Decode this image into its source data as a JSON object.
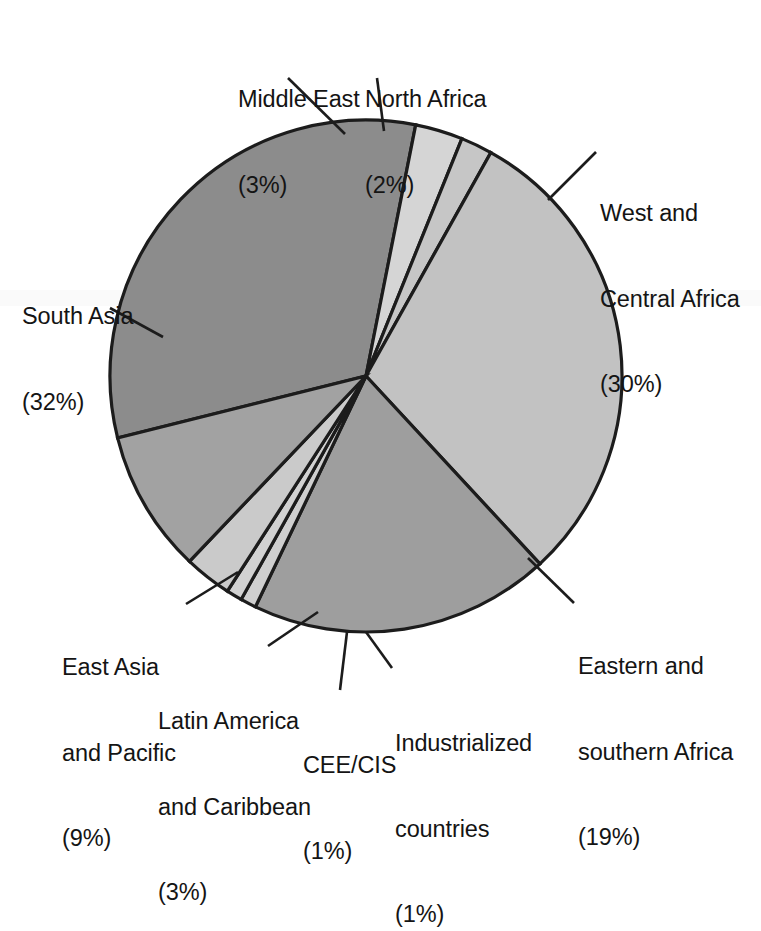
{
  "chart_data": {
    "type": "pie",
    "title": "",
    "subtitle": "",
    "xlabel": "",
    "ylabel": "",
    "legend_position": "callout-labels",
    "grid": false,
    "units": "percent",
    "total": 100,
    "categories": [
      "South Asia",
      "Middle East",
      "North Africa",
      "West and Central Africa",
      "Eastern and southern Africa",
      "Industrialized countries",
      "CEE/CIS",
      "Latin America and Caribbean",
      "East Asia and Pacific"
    ],
    "values": [
      32,
      3,
      2,
      30,
      19,
      1,
      1,
      3,
      9
    ],
    "slices": [
      {
        "name": "south-asia",
        "label_lines": [
          "South Asia",
          "(32%)"
        ],
        "value": 32,
        "value_text": "(32%)",
        "color": "#8c8c8c",
        "start_angle": 256.0,
        "end_angle": 371.2
      },
      {
        "name": "middle-east",
        "label_lines": [
          "Middle East",
          "(3%)"
        ],
        "value": 3,
        "value_text": "(3%)",
        "color": "#d5d5d5",
        "start_angle": 371.2,
        "end_angle": 382.0
      },
      {
        "name": "north-africa",
        "label_lines": [
          "North Africa",
          "(2%)"
        ],
        "value": 2,
        "value_text": "(2%)",
        "color": "#c6c6c6",
        "start_angle": 382.0,
        "end_angle": 389.2
      },
      {
        "name": "west-and-central-africa",
        "label_lines": [
          "West and",
          "Central Africa",
          "(30%)"
        ],
        "value": 30,
        "value_text": "(30%)",
        "color": "#c2c2c2",
        "start_angle": 389.2,
        "end_angle": 497.2
      },
      {
        "name": "eastern-and-southern-africa",
        "label_lines": [
          "Eastern and",
          "southern Africa",
          "(19%)"
        ],
        "value": 19,
        "value_text": "(19%)",
        "color": "#9e9e9e",
        "start_angle": 497.2,
        "end_angle": 565.6
      },
      {
        "name": "industrialized-countries",
        "label_lines": [
          "Industrialized",
          "countries",
          "(1%)"
        ],
        "value": 1,
        "value_text": "(1%)",
        "color": "#cfcfcf",
        "start_angle": 565.6,
        "end_angle": 569.2
      },
      {
        "name": "cee-cis",
        "label_lines": [
          "CEE/CIS",
          "(1%)"
        ],
        "value": 1,
        "value_text": "(1%)",
        "color": "#d2d2d2",
        "start_angle": 569.2,
        "end_angle": 572.8
      },
      {
        "name": "latin-america-and-caribbean",
        "label_lines": [
          "Latin America",
          "and Caribbean",
          "(3%)"
        ],
        "value": 3,
        "value_text": "(3%)",
        "color": "#cacaca",
        "start_angle": 572.8,
        "end_angle": 583.6
      },
      {
        "name": "east-asia-and-pacific",
        "label_lines": [
          "East Asia",
          "and Pacific",
          "(9%)"
        ],
        "value": 9,
        "value_text": "(9%)",
        "color": "#a2a2a2",
        "start_angle": 583.6,
        "end_angle": 616.0
      }
    ],
    "geometry": {
      "center_x": 366,
      "center_y": 376,
      "radius": 256
    },
    "stroke_color": "#1c1c1c",
    "background": "#ffffff"
  },
  "labels": {
    "middle_east": {
      "l1": "Middle East",
      "l2": "(3%)"
    },
    "north_africa": {
      "l1": "North Africa",
      "l2": "(2%)"
    },
    "west_central_africa": {
      "l1": "West and",
      "l2": "Central Africa",
      "l3": "(30%)"
    },
    "eastern_southern_africa": {
      "l1": "Eastern and",
      "l2": "southern Africa",
      "l3": "(19%)"
    },
    "industrialized_countries": {
      "l1": "Industrialized",
      "l2": "countries",
      "l3": "(1%)"
    },
    "cee_cis": {
      "l1": "CEE/CIS",
      "l2": "(1%)"
    },
    "latin_america_caribbean": {
      "l1": "Latin America",
      "l2": "and Caribbean",
      "l3": "(3%)"
    },
    "east_asia_pacific": {
      "l1": "East Asia",
      "l2": "and Pacific",
      "l3": "(9%)"
    },
    "south_asia": {
      "l1": "South Asia",
      "l2": "(32%)"
    }
  }
}
